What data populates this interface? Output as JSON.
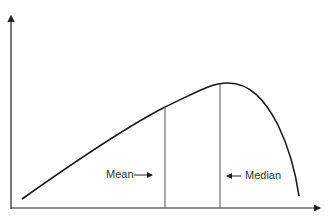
{
  "diagram": {
    "type": "skewed-distribution",
    "labels": {
      "mean": "Mean",
      "median": "Median"
    },
    "arrows": {
      "mean": "→",
      "median": "←"
    },
    "colors": {
      "curve": "#1a1a1a",
      "lines": "#555555",
      "axes": "#222222"
    }
  }
}
